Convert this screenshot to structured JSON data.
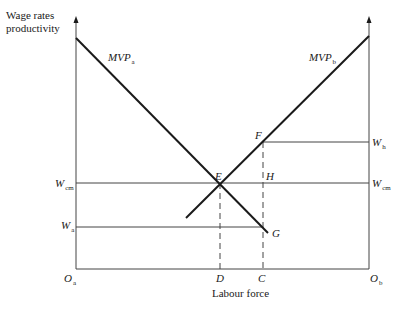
{
  "diagram": {
    "y_axis_label_line1": "Wage rates",
    "y_axis_label_line2": "productivity",
    "x_axis_label": "Labour force",
    "curves": {
      "mvp_a": {
        "main": "MVP",
        "sub": "a"
      },
      "mvp_b": {
        "main": "MVP",
        "sub": "b"
      }
    },
    "points": {
      "E": "E",
      "F": "F",
      "G": "G",
      "H": "H"
    },
    "left_axis_labels": {
      "w_cm": {
        "main": "W",
        "sub": "cm"
      },
      "w_a": {
        "main": "W",
        "sub": "a"
      }
    },
    "right_axis_labels": {
      "w_h": {
        "main": "W",
        "sub": "h"
      },
      "w_cm": {
        "main": "W",
        "sub": "cm"
      }
    },
    "x_axis_points": {
      "o_a": {
        "main": "O",
        "sub": "a"
      },
      "D": "D",
      "C": "C",
      "o_b": {
        "main": "O",
        "sub": "b"
      }
    },
    "colors": {
      "line": "#1a1a1a",
      "thin_line": "#444444",
      "background": "#ffffff"
    }
  }
}
